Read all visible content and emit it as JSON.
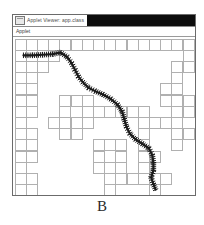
{
  "window": {
    "title": "Applet Viewer: app.class",
    "icon": "applet-window-icon",
    "menu": {
      "items": [
        "Applet"
      ]
    }
  },
  "caption": "B",
  "colors": {
    "wall": "#b0b0b0",
    "path": "#1a1a1a",
    "background": "#ffffff",
    "titlebar_fill": "#0d0d0d",
    "window_border": "#6b6b6b"
  },
  "chart_data": {
    "type": "heatmap",
    "xlabel": "",
    "ylabel": "",
    "grid": {
      "cols": 16,
      "rows": 14,
      "cell_px": 11.2
    },
    "legend": [
      {
        "name": "wall",
        "color": "#b0b0b0"
      },
      {
        "name": "path",
        "color": "#1a1a1a"
      }
    ],
    "walls": [
      [
        0,
        0
      ],
      [
        1,
        0
      ],
      [
        2,
        0
      ],
      [
        3,
        0
      ],
      [
        4,
        0
      ],
      [
        5,
        0
      ],
      [
        6,
        0
      ],
      [
        7,
        0
      ],
      [
        8,
        0
      ],
      [
        9,
        0
      ],
      [
        10,
        0
      ],
      [
        11,
        0
      ],
      [
        12,
        0
      ],
      [
        13,
        0
      ],
      [
        14,
        0
      ],
      [
        15,
        0
      ],
      [
        0,
        1
      ],
      [
        2,
        1
      ],
      [
        3,
        1
      ],
      [
        15,
        1
      ],
      [
        0,
        2
      ],
      [
        1,
        2
      ],
      [
        2,
        2
      ],
      [
        14,
        2
      ],
      [
        15,
        2
      ],
      [
        0,
        3
      ],
      [
        1,
        3
      ],
      [
        14,
        3
      ],
      [
        0,
        4
      ],
      [
        1,
        4
      ],
      [
        13,
        4
      ],
      [
        14,
        4
      ],
      [
        0,
        5
      ],
      [
        1,
        5
      ],
      [
        4,
        5
      ],
      [
        5,
        5
      ],
      [
        6,
        5
      ],
      [
        13,
        5
      ],
      [
        14,
        5
      ],
      [
        15,
        5
      ],
      [
        0,
        6
      ],
      [
        1,
        6
      ],
      [
        4,
        6
      ],
      [
        6,
        6
      ],
      [
        7,
        6
      ],
      [
        8,
        6
      ],
      [
        9,
        6
      ],
      [
        10,
        6
      ],
      [
        11,
        6
      ],
      [
        14,
        6
      ],
      [
        15,
        6
      ],
      [
        0,
        7
      ],
      [
        3,
        7
      ],
      [
        4,
        7
      ],
      [
        5,
        7
      ],
      [
        6,
        7
      ],
      [
        11,
        7
      ],
      [
        12,
        7
      ],
      [
        13,
        7
      ],
      [
        14,
        7
      ],
      [
        0,
        8
      ],
      [
        1,
        8
      ],
      [
        4,
        8
      ],
      [
        5,
        8
      ],
      [
        11,
        8
      ],
      [
        14,
        8
      ],
      [
        15,
        8
      ],
      [
        0,
        9
      ],
      [
        1,
        9
      ],
      [
        7,
        9
      ],
      [
        8,
        9
      ],
      [
        9,
        9
      ],
      [
        11,
        9
      ],
      [
        14,
        9
      ],
      [
        0,
        10
      ],
      [
        1,
        10
      ],
      [
        7,
        10
      ],
      [
        9,
        10
      ],
      [
        11,
        10
      ],
      [
        12,
        10
      ],
      [
        0,
        11
      ],
      [
        7,
        11
      ],
      [
        8,
        11
      ],
      [
        9,
        11
      ],
      [
        11,
        11
      ],
      [
        0,
        12
      ],
      [
        1,
        12
      ],
      [
        8,
        12
      ],
      [
        9,
        12
      ],
      [
        10,
        12
      ],
      [
        11,
        12
      ],
      [
        12,
        12
      ],
      [
        13,
        12
      ],
      [
        0,
        13
      ],
      [
        1,
        13
      ],
      [
        8,
        13
      ],
      [
        12,
        13
      ]
    ],
    "path": [
      [
        0.3,
        1.0
      ],
      [
        1.1,
        1.0
      ],
      [
        2.0,
        0.95
      ],
      [
        2.9,
        0.9
      ],
      [
        3.6,
        0.75
      ],
      [
        4.2,
        1.15
      ],
      [
        4.6,
        1.7
      ],
      [
        4.9,
        2.3
      ],
      [
        5.2,
        2.9
      ],
      [
        5.6,
        3.4
      ],
      [
        6.1,
        3.9
      ],
      [
        6.7,
        4.2
      ],
      [
        7.4,
        4.5
      ],
      [
        8.1,
        4.9
      ],
      [
        8.7,
        5.4
      ],
      [
        9.1,
        6.0
      ],
      [
        9.3,
        6.7
      ],
      [
        9.5,
        7.4
      ],
      [
        9.8,
        8.0
      ],
      [
        10.3,
        8.5
      ],
      [
        10.9,
        8.9
      ],
      [
        11.5,
        9.3
      ],
      [
        11.8,
        9.9
      ],
      [
        11.9,
        10.6
      ],
      [
        11.9,
        11.3
      ],
      [
        11.7,
        11.9
      ],
      [
        11.9,
        12.5
      ],
      [
        12.1,
        13.0
      ]
    ]
  }
}
